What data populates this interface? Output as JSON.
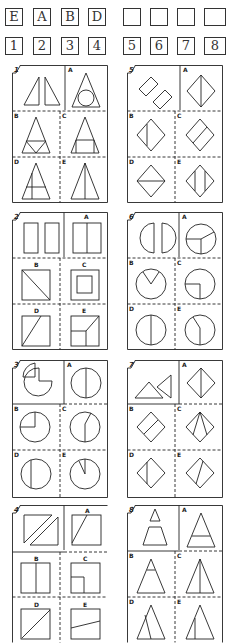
{
  "header": {
    "partial_title": "ANSWER SEQUENCE"
  },
  "answer_row": [
    "E",
    "A",
    "B",
    "D",
    "",
    "",
    "",
    ""
  ],
  "number_row": [
    "1",
    "2",
    "3",
    "4",
    "5",
    "6",
    "7",
    "8"
  ],
  "panels": [
    {
      "number": "1",
      "options": [
        "A",
        "B",
        "C",
        "D",
        "E"
      ],
      "question": "two right triangles",
      "answers": {
        "A": "triangle with inscribed circle",
        "B": "triangle with inner triangle divisions",
        "C": "triangle with inscribed rectangle",
        "D": "triangle with horizontal and vertical line",
        "E": "triangle bisected vertically"
      }
    },
    {
      "number": "2",
      "options": [
        "A",
        "B",
        "C",
        "D",
        "E"
      ],
      "question": "two tall rectangles",
      "answers": {
        "A": "square split vertically",
        "B": "square with diagonal",
        "C": "square with inner square",
        "D": "square with diagonal line",
        "E": "square with L division"
      }
    },
    {
      "number": "3",
      "options": [
        "A",
        "B",
        "C",
        "D",
        "E"
      ],
      "question": "circle with quarter removed",
      "answers": {
        "A": "circle with vertical radius",
        "B": "circle with quarter lines",
        "C": "circle with bent line",
        "D": "circle with chord",
        "E": "circle with narrow wedge"
      }
    },
    {
      "number": "4",
      "options": [
        "A",
        "B",
        "C",
        "D",
        "E"
      ],
      "question": "two parallelogram strips",
      "answers": {
        "A": "square with slanted line",
        "B": "square split vertically",
        "C": "square with inner corner square",
        "D": "square with diagonal",
        "E": "square with slanted horizontal line"
      }
    },
    {
      "number": "5",
      "options": [
        "A",
        "B",
        "C",
        "D",
        "E"
      ],
      "question": "two rectangles rotated",
      "answers": {
        "A": "diamond split vertically",
        "B": "diamond with offset vertical line",
        "C": "diamond with parallel line",
        "D": "diamond split horizontally",
        "E": "diamond with two vertical lines"
      }
    },
    {
      "number": "6",
      "options": [
        "A",
        "B",
        "C",
        "D",
        "E"
      ],
      "question": "two half circles",
      "answers": {
        "A": "circle with three radii",
        "B": "circle with V notch",
        "C": "circle with quarter lines",
        "D": "circle split vertically",
        "E": "circle with bent radius"
      }
    },
    {
      "number": "7",
      "options": [
        "A",
        "B",
        "C",
        "D",
        "E"
      ],
      "question": "two triangles",
      "answers": {
        "A": "diamond split vertically",
        "B": "diamond with parallel line",
        "C": "diamond with fan lines",
        "D": "diamond with offset vertical line",
        "E": "diamond with slanted line"
      }
    },
    {
      "number": "8",
      "options": [
        "A",
        "B",
        "C",
        "D",
        "E"
      ],
      "question": "small triangle and trapezoid",
      "answers": {
        "A": "triangle with low horizontal line",
        "B": "triangle with high horizontal line",
        "C": "triangle bisected vertically",
        "D": "triangle with slanted parallel line",
        "E": "triangle with off-center vertical line"
      }
    }
  ],
  "colors": {
    "ink": "#222222",
    "paper": "#ffffff"
  }
}
